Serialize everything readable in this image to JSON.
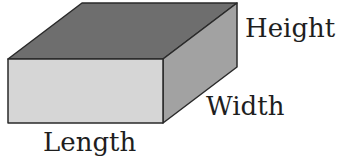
{
  "diagram": {
    "shape": "rectangular-prism",
    "labels": {
      "height": "Height",
      "width": "Width",
      "length": "Length"
    },
    "colors": {
      "top_face": "#6e6e6e",
      "front_face": "#d6d6d6",
      "side_face": "#a2a2a2",
      "edge": "#2a2a2a",
      "text": "#1e1e1e"
    }
  }
}
